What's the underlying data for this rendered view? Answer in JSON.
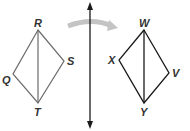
{
  "diagram": {
    "colors": {
      "preimage_stroke": "#6b6b6b",
      "image_stroke": "#1a1a1a",
      "mirror_line": "#1a1a1a",
      "arrow": "#bdbdbd",
      "label": "#333333"
    },
    "preimage": {
      "labels": {
        "R": "R",
        "S": "S",
        "T": "T",
        "Q": "Q"
      }
    },
    "image": {
      "labels": {
        "W": "W",
        "V": "V",
        "Y": "Y",
        "X": "X"
      }
    }
  }
}
